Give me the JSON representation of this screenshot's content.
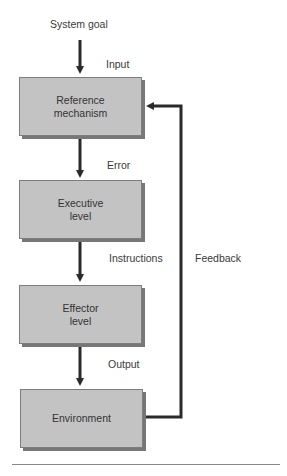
{
  "diagram": {
    "inputs": {
      "system_goal": "System goal",
      "input": "Input"
    },
    "boxes": [
      {
        "id": "reference",
        "lines": [
          "Reference",
          "mechanism"
        ]
      },
      {
        "id": "executive",
        "lines": [
          "Executive",
          "level"
        ]
      },
      {
        "id": "effector",
        "lines": [
          "Effector",
          "level"
        ]
      },
      {
        "id": "environment",
        "lines": [
          "Environment"
        ]
      }
    ],
    "edge_labels": {
      "error": "Error",
      "instructions": "Instructions",
      "output": "Output",
      "feedback": "Feedback"
    },
    "colors": {
      "box_fill": "#c3c3c3",
      "box_shadow": "#777777",
      "arrow": "#2a2a2a",
      "text": "#333333"
    }
  }
}
